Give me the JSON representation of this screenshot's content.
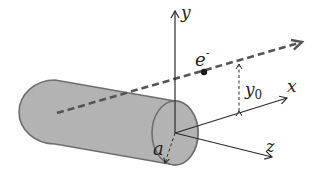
{
  "diagram": {
    "colors": {
      "cylinder_fill": "#b3b3b3",
      "cylinder_edge": "#6e6e6e",
      "line": "#2a2a2a",
      "beam": "#555555",
      "background": "#ffffff"
    },
    "labels": {
      "y_axis": "y",
      "x_axis": "x",
      "z_axis": "z",
      "electron": "e",
      "electron_charge": "-",
      "offset": "y",
      "offset_sub": "0",
      "radius": "a"
    }
  }
}
